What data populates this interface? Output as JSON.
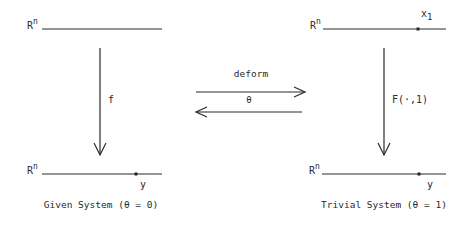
{
  "left_panel": {
    "top_space": {
      "base": "R",
      "sup": "n"
    },
    "map_label": "f",
    "bottom_space": {
      "base": "R",
      "sup": "n"
    },
    "point_label": "y",
    "caption": "Given System (θ = 0)"
  },
  "right_panel": {
    "top_space": {
      "base": "R",
      "sup": "n"
    },
    "top_point": {
      "base": "x",
      "sub": "1"
    },
    "map_label": "F(·,1)",
    "bottom_space": {
      "base": "R",
      "sup": "n"
    },
    "point_label": "y",
    "caption": "Trivial System (θ = 1)"
  },
  "middle": {
    "forward_label": "deform",
    "parameter_label": "θ"
  },
  "colors": {
    "ink": "#2a2a2a",
    "background": "#ffffff"
  }
}
